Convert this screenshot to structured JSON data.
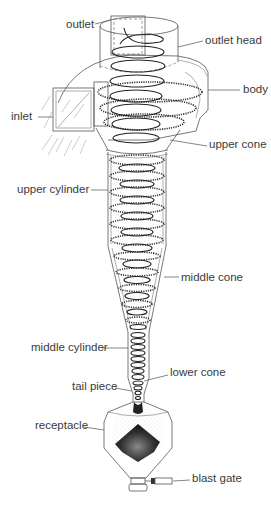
{
  "diagram": {
    "type": "labeled technical illustration",
    "colors": {
      "line": "#555555",
      "coil": "#222222",
      "label_text": "#3a3a3a",
      "background": "#ffffff"
    },
    "labels": [
      {
        "id": "outlet",
        "text": "outlet",
        "side": "left",
        "x": 40,
        "y": 18
      },
      {
        "id": "outlet_head",
        "text": "outlet head",
        "side": "right",
        "x": 205,
        "y": 34
      },
      {
        "id": "body",
        "text": "body",
        "side": "right",
        "x": 243,
        "y": 83
      },
      {
        "id": "inlet",
        "text": "inlet",
        "side": "left",
        "x": 11,
        "y": 110
      },
      {
        "id": "upper_cone",
        "text": "upper cone",
        "side": "right",
        "x": 209,
        "y": 138
      },
      {
        "id": "upper_cylinder",
        "text": "upper cylinder",
        "side": "left",
        "x": 17,
        "y": 183
      },
      {
        "id": "middle_cone",
        "text": "middle cone",
        "side": "right",
        "x": 181,
        "y": 271
      },
      {
        "id": "middle_cylinder",
        "text": "middle cylinder",
        "side": "left",
        "x": 31,
        "y": 341
      },
      {
        "id": "lower_cone",
        "text": "lower cone",
        "side": "right",
        "x": 170,
        "y": 366
      },
      {
        "id": "tail_piece",
        "text": "tail piece",
        "side": "left",
        "x": 72,
        "y": 380
      },
      {
        "id": "receptacle",
        "text": "receptacle",
        "side": "left",
        "x": 35,
        "y": 419
      },
      {
        "id": "blast_gate",
        "text": "blast gate",
        "side": "right",
        "x": 192,
        "y": 472
      }
    ]
  }
}
